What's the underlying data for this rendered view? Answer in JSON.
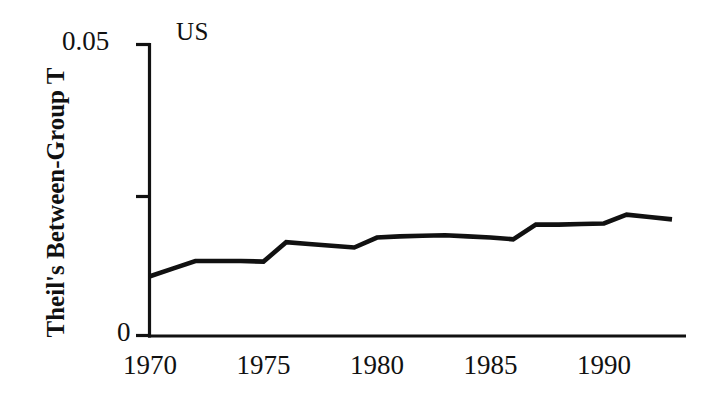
{
  "figure": {
    "panel_label": "US",
    "background_color": "#ffffff",
    "ink_color": "#111111"
  },
  "axes": {
    "y_title": "Theil's Between-Group T",
    "y_tick_labels": [
      "0.05",
      "0"
    ],
    "y_tick_values": [
      0.05,
      0
    ],
    "y_minor_tick_value": 0.025,
    "x_tick_labels": [
      "1970",
      "1975",
      "1980",
      "1985",
      "1990"
    ],
    "x_tick_values": [
      1970,
      1975,
      1980,
      1985,
      1990
    ]
  },
  "chart_data": {
    "type": "line",
    "title": "US",
    "xlabel": "",
    "ylabel": "Theil's Between-Group T",
    "xlim": [
      1970,
      1993
    ],
    "ylim": [
      0,
      0.05
    ],
    "grid": false,
    "legend": false,
    "series": [
      {
        "name": "US",
        "color": "#111111",
        "x": [
          1970,
          1971,
          1972,
          1973,
          1974,
          1975,
          1976,
          1977,
          1978,
          1979,
          1980,
          1981,
          1982,
          1983,
          1984,
          1985,
          1986,
          1987,
          1988,
          1989,
          1990,
          1991,
          1992,
          1993
        ],
        "values": [
          0.0102,
          0.0115,
          0.0128,
          0.0128,
          0.0128,
          0.0127,
          0.016,
          0.0157,
          0.0154,
          0.0151,
          0.0168,
          0.017,
          0.0171,
          0.0172,
          0.017,
          0.0168,
          0.0165,
          0.019,
          0.019,
          0.0191,
          0.0192,
          0.0207,
          0.0203,
          0.0199
        ]
      }
    ]
  }
}
